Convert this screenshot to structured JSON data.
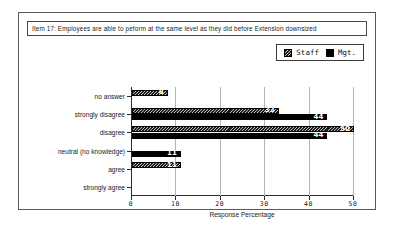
{
  "figure": {
    "title": "Item 17:  Employees are able to peform at the same level as they did before Extension downsized"
  },
  "legend": {
    "position": "top-right",
    "entries": [
      {
        "label": "Staff",
        "swatch": "hatched-dark-square-icon",
        "color": "#1d1d1d"
      },
      {
        "label": "Mgt.",
        "swatch": "solid-black-square-icon",
        "color": "#000000"
      }
    ]
  },
  "chart_data": {
    "type": "bar",
    "orientation": "horizontal",
    "title": "Item 17:  Employees are able to peform at the same level as they did before Extension downsized",
    "xlabel": "Response Percentage",
    "ylabel": "",
    "xlim": [
      0,
      50
    ],
    "xticks": [
      "0",
      "10",
      "20",
      "30",
      "40",
      "50"
    ],
    "grid": "vertical",
    "legend_position": "top-right",
    "categories": [
      "no answer",
      "strongly disagree",
      "disagree",
      "neutral (no knowledge)",
      "agree",
      "strongly agree"
    ],
    "series": [
      {
        "name": "Staff",
        "color": "#1d1d1d",
        "values": [
          8,
          33,
          50,
          0,
          11,
          0
        ]
      },
      {
        "name": "Mgt.",
        "color": "#000000",
        "values": [
          0,
          44,
          44,
          11,
          0,
          0
        ]
      }
    ]
  }
}
